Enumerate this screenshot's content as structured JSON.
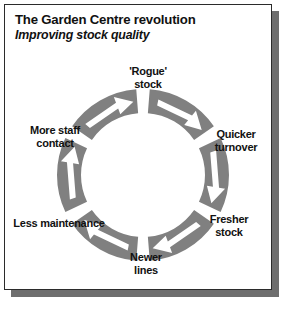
{
  "header": {
    "title": "The Garden Centre revolution",
    "subtitle": "Improving stock quality"
  },
  "colors": {
    "arc": "#808080",
    "arrow": "#ffffff",
    "card_background": "#ffffff",
    "card_border": "#2b2b2b",
    "shadow": "#6e6e6e",
    "text": "#111111"
  },
  "chart_data": {
    "type": "diagram",
    "diagram_style": "cycle",
    "title": "The Garden Centre revolution",
    "subtitle": "Improving stock quality",
    "direction": "clockwise",
    "segment_count": 6,
    "categories": [
      "'Rogue' stock",
      "Quicker turnover",
      "Fresher stock",
      "Newer lines",
      "Less maintenance",
      "More staff contact"
    ],
    "nodes": [
      {
        "id": "rogue-stock",
        "label": "'Rogue'\nstock",
        "position": "top",
        "angle_deg": 270,
        "label_x": 148,
        "label_y": 77
      },
      {
        "id": "quicker-turnover",
        "label": "Quicker\nturnover",
        "position": "upper-right",
        "angle_deg": 330,
        "label_x": 236,
        "label_y": 140
      },
      {
        "id": "fresher-stock",
        "label": "Fresher stock",
        "position": "lower-right",
        "angle_deg": 30,
        "label_x": 229,
        "label_y": 225
      },
      {
        "id": "newer-lines",
        "label": "Newer\nlines",
        "position": "bottom",
        "angle_deg": 90,
        "label_x": 146,
        "label_y": 263
      },
      {
        "id": "less-maintenance",
        "label": "Less maintenance",
        "position": "lower-left",
        "angle_deg": 150,
        "label_x": 59,
        "label_y": 223
      },
      {
        "id": "more-staff-contact",
        "label": "More staff\ncontact",
        "position": "upper-left",
        "angle_deg": 210,
        "label_x": 55,
        "label_y": 136
      }
    ],
    "ring": {
      "center_x": 143,
      "center_y": 175,
      "outer_radius": 86,
      "inner_radius": 62,
      "gap_deg": 9
    }
  }
}
